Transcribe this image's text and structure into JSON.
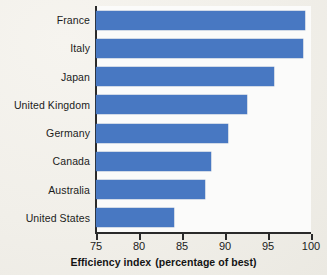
{
  "chart_data": {
    "type": "bar",
    "orientation": "horizontal",
    "title": "",
    "subtitle": "",
    "xlabel": "Efficiency index  (percentage of best)",
    "ylabel": "",
    "categories": [
      "France",
      "Italy",
      "Japan",
      "United Kingdom",
      "Germany",
      "Canada",
      "Australia",
      "United States"
    ],
    "values": [
      99.3,
      99.1,
      95.7,
      92.6,
      90.4,
      88.4,
      87.7,
      84.1
    ],
    "xlim": [
      75,
      100
    ],
    "ylim": null,
    "xticks": [
      75,
      80,
      85,
      90,
      95,
      100
    ],
    "xticklabels": [
      "75",
      "80",
      "85",
      "90",
      "95",
      "100"
    ],
    "grid": false,
    "legend": null,
    "series": [
      {
        "name": "Efficiency index",
        "values": [
          99.3,
          99.1,
          95.7,
          92.6,
          90.4,
          88.4,
          87.7,
          84.1
        ]
      }
    ],
    "colors": {
      "bar": "#4878c2",
      "axis": "#2a2a2a",
      "plot_background": "#fbfbfa",
      "page_background": "#f2f0ea",
      "text": "#1b1b1b"
    }
  },
  "axis": {
    "caption_main": "Efficiency index",
    "caption_paren": "(percentage of best)"
  }
}
